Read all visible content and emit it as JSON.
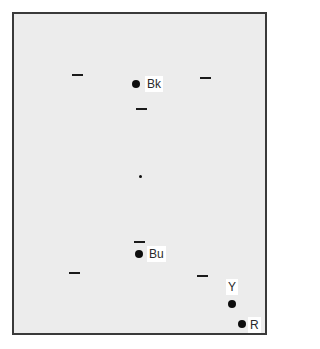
{
  "diagram": {
    "frame": {
      "left": 12,
      "top": 12,
      "right": 268,
      "bottom": 336
    },
    "colors": {
      "background": "#ececec",
      "border": "#3a3a3a",
      "marker": "#0d0d0d",
      "label_bg": "#ffffff"
    },
    "dashes": [
      {
        "x": 72,
        "y": 74
      },
      {
        "x": 200,
        "y": 77
      },
      {
        "x": 136,
        "y": 108
      },
      {
        "x": 134,
        "y": 241
      },
      {
        "x": 69,
        "y": 272
      },
      {
        "x": 197,
        "y": 275
      }
    ],
    "center_dot": {
      "x": 140,
      "y": 176
    },
    "points": [
      {
        "id": "bk",
        "label": "Bk",
        "x": 136,
        "y": 84,
        "label_x": 145,
        "label_y": 76
      },
      {
        "id": "bu",
        "label": "Bu",
        "x": 139,
        "y": 254,
        "label_x": 147,
        "label_y": 246
      },
      {
        "id": "y",
        "label": "Y",
        "x": 232,
        "y": 304,
        "label_x": 226,
        "label_y": 279
      },
      {
        "id": "r",
        "label": "R",
        "x": 242,
        "y": 324,
        "label_x": 248,
        "label_y": 317
      }
    ]
  }
}
